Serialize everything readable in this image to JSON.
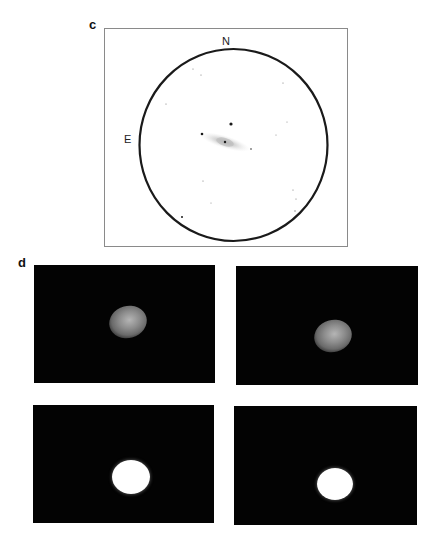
{
  "figure": {
    "panel_c": {
      "label": "c",
      "compass": {
        "north": "N",
        "east": "E"
      },
      "field_circle": {
        "cx": 233.5,
        "cy": 145,
        "rx": 94,
        "ry": 96
      },
      "galaxy": {
        "cx": 225,
        "cy": 142,
        "rx": 26,
        "ry": 4,
        "angle_deg": 17
      },
      "stars": [
        {
          "x": 231,
          "y": 124,
          "r": 1.6
        },
        {
          "x": 202,
          "y": 134,
          "r": 1.3
        },
        {
          "x": 225,
          "y": 142,
          "r": 1.2
        },
        {
          "x": 251,
          "y": 149,
          "r": 0.9
        },
        {
          "x": 193,
          "y": 69,
          "r": 0.6
        },
        {
          "x": 201,
          "y": 75,
          "r": 0.6
        },
        {
          "x": 283,
          "y": 83,
          "r": 0.6
        },
        {
          "x": 166,
          "y": 104,
          "r": 0.6
        },
        {
          "x": 287,
          "y": 122,
          "r": 0.5
        },
        {
          "x": 276,
          "y": 135,
          "r": 0.5
        },
        {
          "x": 203,
          "y": 181,
          "r": 0.6
        },
        {
          "x": 211,
          "y": 203,
          "r": 0.5
        },
        {
          "x": 182,
          "y": 217,
          "r": 1.0
        },
        {
          "x": 293,
          "y": 190,
          "r": 0.6
        },
        {
          "x": 296,
          "y": 199,
          "r": 0.6
        },
        {
          "x": 295,
          "y": 211,
          "r": 0.7
        }
      ]
    },
    "panel_d": {
      "label": "d",
      "images": [
        {
          "name": "top-left",
          "x": 34,
          "y": 265,
          "w": 181,
          "h": 118,
          "blob": {
            "cx": 128,
            "cy": 322,
            "w": 38,
            "h": 32,
            "style": "diffuse"
          }
        },
        {
          "name": "top-right",
          "x": 236,
          "y": 266,
          "w": 182,
          "h": 119,
          "blob": {
            "cx": 333,
            "cy": 336,
            "w": 38,
            "h": 32,
            "style": "diffuse"
          }
        },
        {
          "name": "bottom-left",
          "x": 33,
          "y": 405,
          "w": 181,
          "h": 118,
          "blob": {
            "cx": 131,
            "cy": 477,
            "w": 38,
            "h": 34,
            "style": "saturated"
          }
        },
        {
          "name": "bottom-right",
          "x": 234,
          "y": 406,
          "w": 183,
          "h": 119,
          "blob": {
            "cx": 335,
            "cy": 484,
            "w": 36,
            "h": 32,
            "style": "saturated"
          }
        }
      ]
    }
  }
}
